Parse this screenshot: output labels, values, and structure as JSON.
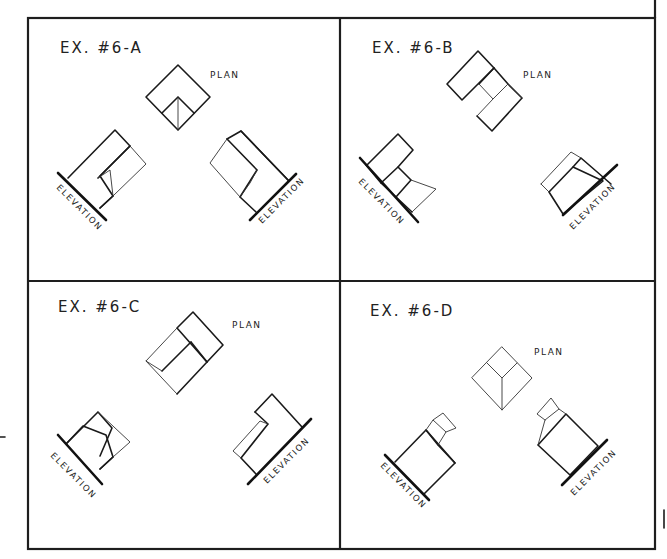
{
  "sheet": {
    "background": "#ffffff",
    "ink": "#1e1e1e",
    "frame": {
      "left": 28,
      "top": 18,
      "right": 655,
      "bottom": 549,
      "mid_x": 340,
      "mid_y": 281
    },
    "stray_marks": [
      {
        "x1": 0,
        "y1": 437,
        "x2": 5,
        "y2": 437
      },
      {
        "x1": 664,
        "y1": 510,
        "x2": 664,
        "y2": 528
      }
    ]
  },
  "panels": [
    {
      "id": "6-A",
      "title": "EX. #6-A",
      "title_pos": [
        60,
        53
      ],
      "plan_label": "PLAN",
      "plan_label_pos": [
        210,
        78
      ],
      "plan": {
        "heavy": [
          "M178,65 L210,97 L178,130 L146,97 Z",
          "M162,113 L178,97 L194,113"
        ],
        "thin": [
          "M178,97 L178,130"
        ]
      },
      "left_elevation": {
        "label": "ELEVATION",
        "label_pos": [
          56,
          188
        ],
        "label_angle": 45,
        "ground": "M58,173 L106,220",
        "heavy": [
          "M68,178 L115,130 L130,146 L100,176 L113,196 L100,208",
          "M130,146 L98,178",
          "M100,208 L113,196"
        ],
        "thin": [
          "M130,146 L146,164 L113,196",
          "M98,178 L110,170 L113,196"
        ]
      },
      "right_elevation": {
        "label": "ELEVATION",
        "label_pos": [
          262,
          224
        ],
        "label_angle": -45,
        "ground": "M250,220 L296,174",
        "heavy": [
          "M227,139 L241,131 L288,180",
          "M227,139 L257,170 L240,197 L256,212",
          "M241,131 L288,180"
        ],
        "thin": [
          "M227,139 L210,163 L240,197",
          "M257,170 L250,183 L240,197"
        ]
      }
    },
    {
      "id": "6-B",
      "title": "EX. #6-B",
      "title_pos": [
        372,
        53
      ],
      "plan_label": "PLAN",
      "plan_label_pos": [
        523,
        78
      ],
      "plan": {
        "heavy": [
          "M478,51 L494,68 L462,100 L447,84 Z",
          "M494,68 L508,84 L522,98 L492,131 L477,116",
          "M479,84 L494,68"
        ],
        "thin": [
          "M479,84 L493,99 L508,84",
          "M493,99 L477,116",
          "M508,84 L522,98"
        ]
      },
      "left_elevation": {
        "label": "ELEVATION",
        "label_pos": [
          358,
          182
        ],
        "label_angle": 45,
        "ground": "M360,158 L418,222",
        "heavy": [
          "M367,165 L398,134 L413,150 L398,167 L381,183 L366,165",
          "M398,167 L411,180 L396,197",
          "M381,183 L396,197 L412,212"
        ],
        "thin": [
          "M411,180 L436,189 L412,212"
        ]
      },
      "right_elevation": {
        "label": "ELEVATION",
        "label_pos": [
          573,
          230
        ],
        "label_angle": -45,
        "ground": "M563,215 L617,165",
        "heavy": [
          "M549,192 L573,167 L603,181 L563,214 L549,192 Z",
          "M573,167 L581,158 L611,184"
        ],
        "thin": [
          "M541,184 L571,152 L581,158",
          "M541,184 L549,192"
        ]
      }
    },
    {
      "id": "6-C",
      "title": "EX. #6-C",
      "title_pos": [
        58,
        312
      ],
      "plan_label": "PLAN",
      "plan_label_pos": [
        232,
        328
      ],
      "plan": {
        "heavy": [
          "M193,312 L223,345 L207,362 L177,328 Z",
          "M191,342 L207,362",
          "M191,342 L162,371",
          "M207,362 L177,394"
        ],
        "thin": [
          "M177,328 L146,361 L177,394",
          "M146,361 L162,371"
        ]
      },
      "left_elevation": {
        "label": "ELEVATION",
        "label_pos": [
          50,
          456
        ],
        "label_angle": 45,
        "ground": "M58,435 L102,484",
        "heavy": [
          "M67,443 L98,412 L112,428 L100,456",
          "M67,443 L83,426 L106,435 L113,457 L100,469",
          "M100,469 L113,457"
        ],
        "thin": [
          "M98,412 L130,442 L113,457"
        ]
      },
      "right_elevation": {
        "label": "ELEVATION",
        "label_pos": [
          267,
          484
        ],
        "label_angle": -45,
        "ground": "M248,484 L311,419",
        "heavy": [
          "M255,412 L272,394 L302,427",
          "M255,412 L268,424 L241,458 L256,474"
        ],
        "thin": [
          "M241,458 L233,451 L260,421 L268,424"
        ]
      }
    },
    {
      "id": "6-D",
      "title": "EX. #6-D",
      "title_pos": [
        370,
        316
      ],
      "plan_label": "PLAN",
      "plan_label_pos": [
        534,
        355
      ],
      "plan": {
        "heavy": [],
        "thin": [
          "M502,347 L532,378 L502,410 L472,378 Z",
          "M487,363 L502,378 L517,363",
          "M502,378 L502,410"
        ]
      },
      "left_elevation": {
        "label": "ELEVATION",
        "label_pos": [
          380,
          466
        ],
        "label_angle": 45,
        "ground": "M385,455 L429,500",
        "heavy": [
          "M395,462 L426,430 L455,463 L424,494",
          "M426,430 L438,445 L455,463"
        ],
        "thin": [
          "M426,430 L433,420 L446,432 L438,445",
          "M433,420 L443,413 L456,428 L446,432"
        ]
      },
      "right_elevation": {
        "label": "ELEVATION",
        "label_pos": [
          574,
          496
        ],
        "label_angle": -45,
        "ground": "M562,485 L607,440",
        "heavy": [
          "M538,445 L566,414 L598,446 L570,475 L538,445"
        ],
        "thin": [
          "M538,445 L545,420 L559,409 L566,414",
          "M545,420 L537,414 L551,398 L559,409"
        ]
      }
    }
  ]
}
